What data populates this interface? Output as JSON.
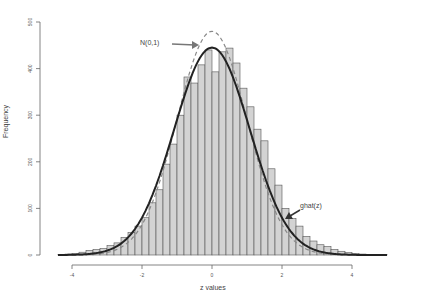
{
  "chart_data": {
    "type": "bar",
    "title": "",
    "xlabel": "z values",
    "ylabel": "Frequency",
    "xlim": [
      -4.5,
      5.5
    ],
    "ylim": [
      0,
      500
    ],
    "xticks": [
      -4,
      -2,
      0,
      2,
      4
    ],
    "yticks": [
      0,
      100,
      200,
      300,
      400,
      500
    ],
    "grid": false,
    "bin_width": 0.2,
    "bin_starts": [
      -4.4,
      -4.2,
      -4.0,
      -3.8,
      -3.6,
      -3.4,
      -3.2,
      -3.0,
      -2.8,
      -2.6,
      -2.4,
      -2.2,
      -2.0,
      -1.8,
      -1.6,
      -1.4,
      -1.2,
      -1.0,
      -0.8,
      -0.6,
      -0.4,
      -0.2,
      0.0,
      0.2,
      0.4,
      0.6,
      0.8,
      1.0,
      1.2,
      1.4,
      1.6,
      1.8,
      2.0,
      2.2,
      2.4,
      2.6,
      2.8,
      3.0,
      3.2,
      3.4,
      3.6,
      3.8,
      4.0,
      4.2,
      4.4,
      4.6,
      4.8
    ],
    "values": [
      1,
      2,
      3,
      6,
      10,
      12,
      14,
      20,
      26,
      38,
      48,
      62,
      80,
      112,
      140,
      195,
      238,
      300,
      382,
      369,
      408,
      440,
      393,
      436,
      444,
      412,
      358,
      318,
      270,
      245,
      185,
      150,
      100,
      78,
      62,
      40,
      30,
      22,
      18,
      12,
      8,
      5,
      3,
      2,
      1,
      1,
      1
    ],
    "bar_fill": "#d3d3d3",
    "bar_stroke": "#555555",
    "curves": [
      {
        "name": "N(0,1)",
        "style": "dashed",
        "color": "#888888",
        "scale": 480,
        "mean": 0,
        "sd": 1
      },
      {
        "name": "ghat(z)",
        "style": "solid",
        "color": "#222222",
        "scale": 445,
        "mean": 0,
        "sd": 1.08
      }
    ],
    "annotations": [
      {
        "text": "N(0,1)",
        "x": -1.0,
        "y": 440,
        "arrow_to": [
          -0.35,
          435
        ]
      },
      {
        "text": "ghat(z)",
        "x": 2.6,
        "y": 100,
        "arrow_to": [
          2.1,
          80
        ]
      }
    ]
  },
  "labels": {
    "xlabel": "z values",
    "ylabel": "Frequency",
    "ann_normal": "N(0,1)",
    "ann_ghat": "ghat(z)"
  }
}
